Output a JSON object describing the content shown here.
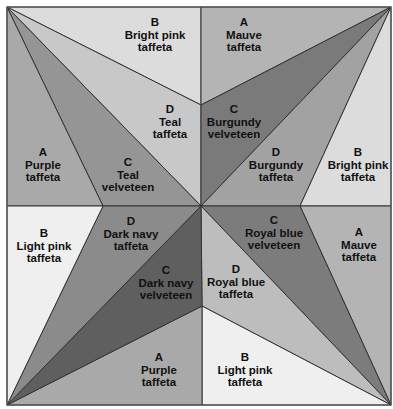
{
  "quilt": {
    "title": "Pinwheel quilt block fabric layout",
    "frame": {
      "x1": 7,
      "y1": 7,
      "x2": 391,
      "y2": 405
    },
    "center": {
      "x": 201,
      "y": 206
    },
    "colors": {
      "bright_pink": "#dcdcdc",
      "light_pink": "#ededed",
      "purple": "#a9a9a9",
      "mauve": "#b4b4b4",
      "teal_velveteen": "#8f8f8f",
      "teal_taffeta": "#c8c8c8",
      "burgundy_velveteen": "#777777",
      "burgundy_taffeta": "#a0a0a0",
      "royal_blue_velveteen": "#7a7a7a",
      "royal_blue_taffeta": "#bcbcbc",
      "dark_navy_velveteen": "#5e5e5e",
      "dark_navy_taffeta": "#8a8a8a",
      "outline": "#333333"
    },
    "pieces": [
      {
        "id": "tl-b",
        "quadrant": "top-left",
        "letter": "B",
        "line1": "Bright pink",
        "line2": "taffeta",
        "label_x": 155,
        "label_y": 35
      },
      {
        "id": "tl-d",
        "quadrant": "top-left",
        "letter": "D",
        "line1": "Teal",
        "line2": "taffeta",
        "label_x": 170,
        "label_y": 122
      },
      {
        "id": "tl-c",
        "quadrant": "top-left",
        "letter": "C",
        "line1": "Teal",
        "line2": "velveteen",
        "label_x": 128,
        "label_y": 175
      },
      {
        "id": "tl-a",
        "quadrant": "top-left",
        "letter": "A",
        "line1": "Purple",
        "line2": "taffeta",
        "label_x": 43,
        "label_y": 165
      },
      {
        "id": "tr-a",
        "quadrant": "top-right",
        "letter": "A",
        "line1": "Mauve",
        "line2": "taffeta",
        "label_x": 244,
        "label_y": 35
      },
      {
        "id": "tr-c",
        "quadrant": "top-right",
        "letter": "C",
        "line1": "Burgundy",
        "line2": "velveteen",
        "label_x": 234,
        "label_y": 122
      },
      {
        "id": "tr-d",
        "quadrant": "top-right",
        "letter": "D",
        "line1": "Burgundy",
        "line2": "taffeta",
        "label_x": 276,
        "label_y": 165
      },
      {
        "id": "tr-b",
        "quadrant": "top-right",
        "letter": "B",
        "line1": "Bright pink",
        "line2": "taffeta",
        "label_x": 358,
        "label_y": 165
      },
      {
        "id": "br-c",
        "quadrant": "bottom-right",
        "letter": "C",
        "line1": "Royal blue",
        "line2": "velveteen",
        "label_x": 274,
        "label_y": 233
      },
      {
        "id": "br-a",
        "quadrant": "bottom-right",
        "letter": "A",
        "line1": "Mauve",
        "line2": "taffeta",
        "label_x": 359,
        "label_y": 245
      },
      {
        "id": "br-d",
        "quadrant": "bottom-right",
        "letter": "D",
        "line1": "Royal blue",
        "line2": "taffeta",
        "label_x": 236,
        "label_y": 282
      },
      {
        "id": "br-b",
        "quadrant": "bottom-right",
        "letter": "B",
        "line1": "Light pink",
        "line2": "taffeta",
        "label_x": 245,
        "label_y": 370
      },
      {
        "id": "bl-b",
        "quadrant": "bottom-left",
        "letter": "B",
        "line1": "Light pink",
        "line2": "taffeta",
        "label_x": 44,
        "label_y": 246
      },
      {
        "id": "bl-d",
        "quadrant": "bottom-left",
        "letter": "D",
        "line1": "Dark navy",
        "line2": "taffeta",
        "label_x": 131,
        "label_y": 234
      },
      {
        "id": "bl-c",
        "quadrant": "bottom-left",
        "letter": "C",
        "line1": "Dark navy",
        "line2": "velveteen",
        "label_x": 166,
        "label_y": 283
      },
      {
        "id": "bl-a",
        "quadrant": "bottom-left",
        "letter": "A",
        "line1": "Purple",
        "line2": "taffeta",
        "label_x": 159,
        "label_y": 370
      }
    ]
  }
}
